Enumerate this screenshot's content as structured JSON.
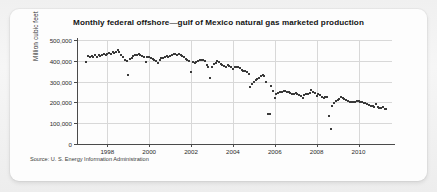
{
  "card": {
    "source_note": "Source: U. S. Energy Information Administration"
  },
  "chart_data": {
    "type": "scatter",
    "title": "Monthly federal offshore—gulf of Mexico natural gas marketed production",
    "xlabel": "",
    "ylabel": "Million cubic feet",
    "xlim": [
      1996.6,
      2011.6
    ],
    "ylim": [
      0,
      500000
    ],
    "grid": true,
    "legend": "none",
    "y_ticks": [
      0,
      100000,
      200000,
      300000,
      400000,
      500000
    ],
    "y_tick_labels": [
      "0",
      "100,000",
      "200,000",
      "300,000",
      "400,000",
      "500,000"
    ],
    "x_ticks": [
      1998,
      2000,
      2002,
      2004,
      2006,
      2008,
      2010
    ],
    "x_tick_labels": [
      "1998",
      "2000",
      "2002",
      "2004",
      "2006",
      "2008",
      "2010"
    ],
    "marker_color": "#3a3a3a",
    "gridline_color": "#d8d8d8",
    "axis_color": "#4a4a4a",
    "series": [
      {
        "name": "Monthly marketed production",
        "x": [
          1997.0,
          1997.08,
          1997.17,
          1997.25,
          1997.33,
          1997.42,
          1997.5,
          1997.58,
          1997.67,
          1997.75,
          1997.83,
          1997.92,
          1998.0,
          1998.08,
          1998.17,
          1998.25,
          1998.33,
          1998.42,
          1998.5,
          1998.58,
          1998.67,
          1998.75,
          1998.83,
          1998.92,
          1999.0,
          1999.08,
          1999.17,
          1999.25,
          1999.33,
          1999.42,
          1999.5,
          1999.58,
          1999.67,
          1999.75,
          1999.83,
          1999.92,
          2000.0,
          2000.08,
          2000.17,
          2000.25,
          2000.33,
          2000.42,
          2000.5,
          2000.58,
          2000.67,
          2000.75,
          2000.83,
          2000.92,
          2001.0,
          2001.08,
          2001.17,
          2001.25,
          2001.33,
          2001.42,
          2001.5,
          2001.58,
          2001.67,
          2001.75,
          2001.83,
          2001.92,
          2002.0,
          2002.08,
          2002.17,
          2002.25,
          2002.33,
          2002.42,
          2002.5,
          2002.58,
          2002.67,
          2002.75,
          2002.83,
          2002.92,
          2003.0,
          2003.08,
          2003.17,
          2003.25,
          2003.33,
          2003.42,
          2003.5,
          2003.58,
          2003.67,
          2003.75,
          2003.83,
          2003.92,
          2004.0,
          2004.08,
          2004.17,
          2004.25,
          2004.33,
          2004.42,
          2004.5,
          2004.58,
          2004.67,
          2004.75,
          2004.83,
          2004.92,
          2005.0,
          2005.08,
          2005.17,
          2005.25,
          2005.33,
          2005.42,
          2005.5,
          2005.58,
          2005.67,
          2005.75,
          2005.83,
          2005.92,
          2006.0,
          2006.08,
          2006.17,
          2006.25,
          2006.33,
          2006.42,
          2006.5,
          2006.58,
          2006.67,
          2006.75,
          2006.83,
          2006.92,
          2007.0,
          2007.08,
          2007.17,
          2007.25,
          2007.33,
          2007.42,
          2007.5,
          2007.58,
          2007.67,
          2007.75,
          2007.83,
          2007.92,
          2008.0,
          2008.08,
          2008.17,
          2008.25,
          2008.33,
          2008.42,
          2008.5,
          2008.58,
          2008.67,
          2008.75,
          2008.83,
          2008.92,
          2009.0,
          2009.08,
          2009.17,
          2009.25,
          2009.33,
          2009.42,
          2009.5,
          2009.58,
          2009.67,
          2009.75,
          2009.83,
          2009.92,
          2010.0,
          2010.08,
          2010.17,
          2010.25,
          2010.33,
          2010.42,
          2010.5,
          2010.58,
          2010.67,
          2010.75,
          2010.83,
          2010.92,
          2011.0,
          2011.08,
          2011.17,
          2011.25,
          2011.33
        ],
        "values": [
          393000,
          421000,
          419000,
          424000,
          418000,
          426000,
          420000,
          428000,
          424000,
          430000,
          431000,
          428000,
          433000,
          437000,
          432000,
          440000,
          438000,
          444000,
          451000,
          443000,
          429000,
          416000,
          404000,
          398000,
          333000,
          410000,
          413000,
          424000,
          430000,
          428000,
          433000,
          427000,
          422000,
          419000,
          396000,
          420000,
          417000,
          412000,
          408000,
          404000,
          400000,
          389000,
          405000,
          412000,
          414000,
          418000,
          422000,
          419000,
          424000,
          430000,
          432000,
          434000,
          428000,
          435000,
          430000,
          424000,
          418000,
          409000,
          402000,
          401000,
          345000,
          396000,
          390000,
          396000,
          401000,
          405000,
          402000,
          404000,
          398000,
          381000,
          368000,
          316000,
          372000,
          383000,
          390000,
          398000,
          394000,
          386000,
          380000,
          376000,
          372000,
          378000,
          374000,
          370000,
          361000,
          368000,
          372000,
          370000,
          365000,
          358000,
          352000,
          349000,
          345000,
          338000,
          272000,
          290000,
          298000,
          308000,
          312000,
          318000,
          325000,
          330000,
          327000,
          300000,
          145000,
          143000,
          281000,
          255000,
          219000,
          238000,
          245000,
          250000,
          252000,
          254000,
          256000,
          251000,
          248000,
          244000,
          242000,
          240000,
          246000,
          238000,
          234000,
          230000,
          222000,
          235000,
          238000,
          240000,
          243000,
          262000,
          248000,
          244000,
          232000,
          238000,
          235000,
          228000,
          222000,
          224000,
          226000,
          136000,
          70000,
          185000,
          196000,
          205000,
          212000,
          218000,
          225000,
          221000,
          216000,
          210000,
          207000,
          204000,
          201000,
          200000,
          203000,
          206000,
          208000,
          204000,
          200000,
          198000,
          195000,
          192000,
          188000,
          185000,
          182000,
          178000,
          190000,
          176000,
          172000,
          175000,
          178000,
          170000,
          168000
        ]
      }
    ]
  }
}
